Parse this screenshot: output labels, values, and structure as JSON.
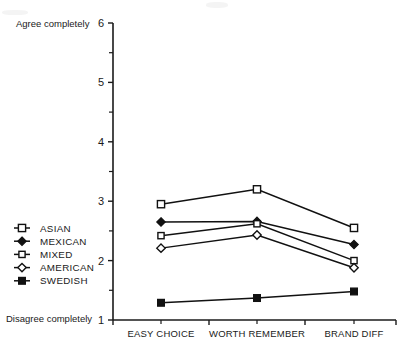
{
  "chart_data": {
    "type": "line",
    "title": "",
    "xlabel": "",
    "ylabel": "",
    "categories": [
      "EASY CHOICE",
      "WORTH REMEMBER",
      "BRAND DIFF"
    ],
    "ylim": [
      1,
      6
    ],
    "yticks": [
      1,
      2,
      3,
      4,
      5,
      6
    ],
    "ytick_labels": [
      "1",
      "2",
      "3",
      "4",
      "5",
      "6"
    ],
    "y_minor_ticks": [
      1.5,
      2.5,
      3.5,
      4.5,
      5.5
    ],
    "grid": false,
    "legend_position": "left-middle",
    "scale_top_label": "Agree completely",
    "scale_bottom_label": "Disagree completely",
    "series": [
      {
        "name": "ASIAN",
        "marker": "open-square",
        "values": [
          2.95,
          3.2,
          2.55
        ]
      },
      {
        "name": "MEXICAN",
        "marker": "filled-diamond",
        "values": [
          2.65,
          2.66,
          2.27
        ]
      },
      {
        "name": "MIXED",
        "marker": "open-square-small",
        "values": [
          2.42,
          2.62,
          2.0
        ]
      },
      {
        "name": "AMERICAN",
        "marker": "open-diamond",
        "values": [
          2.21,
          2.43,
          1.88
        ]
      },
      {
        "name": "SWEDISH",
        "marker": "filled-square",
        "values": [
          1.29,
          1.37,
          1.48
        ]
      }
    ]
  },
  "legend": {
    "items": [
      {
        "label": "ASIAN"
      },
      {
        "label": "MEXICAN"
      },
      {
        "label": "MIXED"
      },
      {
        "label": "AMERICAN"
      },
      {
        "label": "SWEDISH"
      }
    ]
  }
}
